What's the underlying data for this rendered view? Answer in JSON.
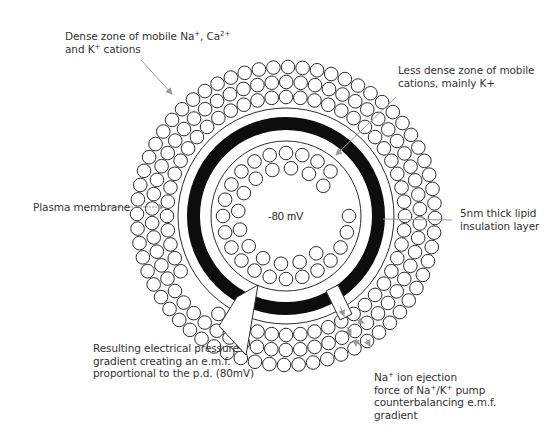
{
  "diagram": {
    "center_voltage": "-80 mV",
    "labels": {
      "dense_zone": {
        "line1_a": "Dense zone of mobile Na",
        "line1_sup1": "+",
        "line1_b": ", Ca",
        "line1_sup2": "2+",
        "line2_a": "and K",
        "line2_sup": "+",
        "line2_b": " cations"
      },
      "less_dense_zone": {
        "line1": "Less dense zone of mobile",
        "line2": "cations, mainly K+"
      },
      "plasma_membrane": "Plasma membrane",
      "lipid_layer": {
        "line1": "5nm thick lipid",
        "line2": "insulation layer"
      },
      "electrical_pressure": {
        "line1": "Resulting electrical pressure",
        "line2": "gradient creating an e.m.f.",
        "line3": "proportional to the p.d. (80mV)"
      },
      "na_ejection": {
        "line1_a": "Na",
        "line1_sup": "+",
        "line1_b": " ion ejection",
        "line2_a": "force of Na",
        "line2_sup1": "+",
        "line2_mid": "/K",
        "line2_sup2": "+",
        "line2_b": " pump",
        "line3": "counterbalancing e.m.f.",
        "line4": "gradient"
      }
    },
    "geometry": {
      "center": [
        286,
        216
      ],
      "outer_membrane_radius": 108,
      "black_ring_outer": 99,
      "black_ring_inner": 86,
      "inner_membrane_radius": 75,
      "ion_radius": 6.8
    },
    "outer_ion_rows": [
      {
        "radius": 119,
        "count": 52
      },
      {
        "radius": 134,
        "count": 58
      },
      {
        "radius": 149,
        "count": 64
      }
    ],
    "inner_ion_rows": [
      {
        "radius": 63,
        "count": 24
      },
      {
        "radius": 48,
        "count": 16
      }
    ],
    "colors": {
      "stroke": "#2b2b2b",
      "membrane_black": "#0d0d0d",
      "pointer": "#9a9a9a",
      "background": "#ffffff"
    }
  }
}
